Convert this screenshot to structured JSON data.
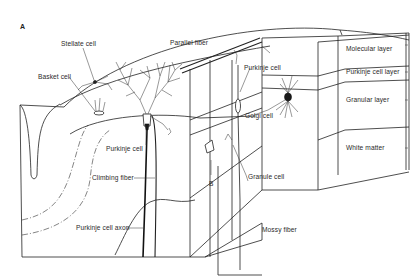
{
  "figure": {
    "panel_letter": "A",
    "labels": {
      "stellate_cell": "Stellate cell",
      "parallel_fiber": "Parallel fiber",
      "basket_cell": "Basket cell",
      "purkinje_cell_left": "Purkinje cell",
      "climbing_fiber": "Climbing fiber",
      "purkinje_cell_axon": "Purkinje cell axon",
      "purkinje_cell_right": "Purkinje cell",
      "golgi_cell": "Golgi cell",
      "granule_cell": "Granule cell",
      "mossy_fiber": "Mossy fiber",
      "marker_b": "B"
    },
    "layers": [
      {
        "name": "Molecular layer"
      },
      {
        "name": "Purkinje cell layer"
      },
      {
        "name": "Granular layer"
      },
      {
        "name": "White matter"
      }
    ]
  },
  "colors": {
    "ink": "#222222",
    "paper": "#ffffff"
  }
}
